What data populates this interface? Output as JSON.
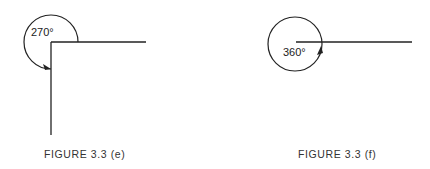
{
  "figures": [
    {
      "id": "e",
      "caption": "FIGURE 3.3 (e)",
      "angle_label": "270°",
      "angle_degrees": 270
    },
    {
      "id": "f",
      "caption": "FIGURE 3.3 (f)",
      "angle_label": "360°",
      "angle_degrees": 360
    }
  ],
  "colors": {
    "stroke": "#222222",
    "background": "#ffffff"
  }
}
